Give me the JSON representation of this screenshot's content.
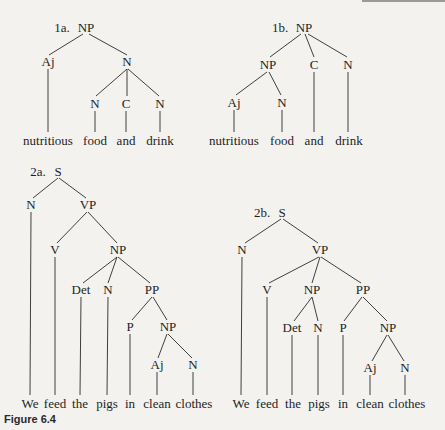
{
  "figure": {
    "caption": "Figure 6.4"
  },
  "trees": {
    "t1a": {
      "label": "1a.",
      "root": "NP",
      "nodes": {
        "n_root": "NP",
        "n_aj": "Aj",
        "n_n": "N",
        "n_n1": "N",
        "n_c": "C",
        "n_n2": "N"
      },
      "words": [
        "nutritious",
        "food",
        "and",
        "drink"
      ]
    },
    "t1b": {
      "label": "1b.",
      "root": "NP",
      "nodes": {
        "n_root": "NP",
        "n_np": "NP",
        "n_c": "C",
        "n_n": "N",
        "n_aj": "Aj",
        "n_n1": "N"
      },
      "words": [
        "nutritious",
        "food",
        "and",
        "drink"
      ]
    },
    "t2a": {
      "label": "2a.",
      "root": "S",
      "nodes": {
        "n_root": "S",
        "n_n": "N",
        "n_vp": "VP",
        "n_v": "V",
        "n_np": "NP",
        "n_det": "Det",
        "n_n2": "N",
        "n_pp": "PP",
        "n_p": "P",
        "n_np2": "NP",
        "n_aj": "Aj",
        "n_n3": "N"
      },
      "words": [
        "We",
        "feed",
        "the",
        "pigs",
        "in",
        "clean",
        "clothes"
      ]
    },
    "t2b": {
      "label": "2b.",
      "root": "S",
      "nodes": {
        "n_root": "S",
        "n_n": "N",
        "n_vp": "VP",
        "n_v": "V",
        "n_np": "NP",
        "n_pp": "PP",
        "n_det": "Det",
        "n_n2": "N",
        "n_p": "P",
        "n_np2": "NP",
        "n_aj": "Aj",
        "n_n3": "N"
      },
      "words": [
        "We",
        "feed",
        "the",
        "pigs",
        "in",
        "clean",
        "clothes"
      ]
    }
  }
}
